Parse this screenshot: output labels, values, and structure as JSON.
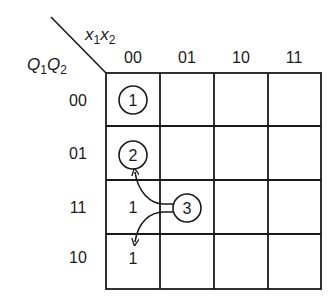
{
  "kmap": {
    "column_variable_label": {
      "base1": "x",
      "sub1": "1",
      "base2": "x",
      "sub2": "2"
    },
    "row_variable_label": {
      "base1": "Q",
      "sub1": "1",
      "base2": "Q",
      "sub2": "2"
    },
    "column_headers": [
      "00",
      "01",
      "10",
      "11"
    ],
    "row_headers": [
      "00",
      "01",
      "11",
      "10"
    ],
    "cells": [
      [
        "(1)",
        "",
        "",
        ""
      ],
      [
        "(2)",
        "",
        "",
        ""
      ],
      [
        "1",
        "",
        "",
        ""
      ],
      [
        "1",
        "",
        "",
        ""
      ]
    ],
    "stable_state_1": "1",
    "stable_state_2": "2",
    "unstable_entry_r3": "1",
    "unstable_entry_r4": "1",
    "callout_label": "3",
    "colors": {
      "line": "#1a1a1a",
      "background": "#ffffff"
    }
  }
}
